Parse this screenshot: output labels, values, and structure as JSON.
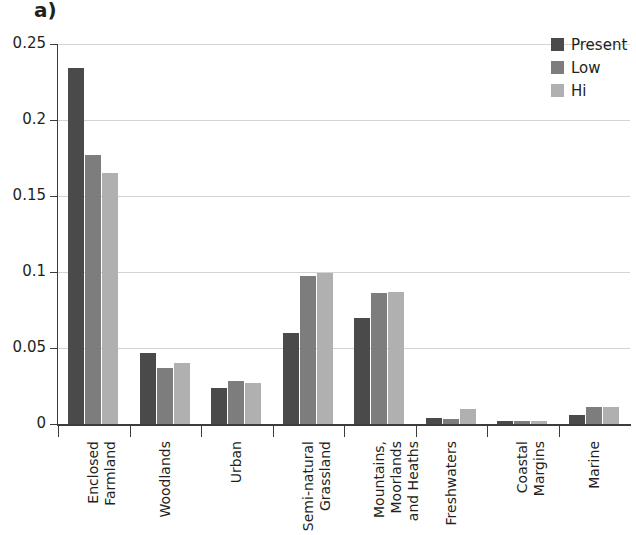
{
  "panel": {
    "label": "a)",
    "title_sliver": ""
  },
  "legend": {
    "position": "top-right",
    "entries": [
      {
        "label": "Present",
        "color": "#4a4a4a"
      },
      {
        "label": "Low",
        "color": "#7d7d7d"
      },
      {
        "label": "Hi",
        "color": "#b0b0b0"
      }
    ]
  },
  "chart_data": {
    "type": "bar",
    "title": "",
    "xlabel": "",
    "ylabel": "",
    "ylim": [
      0,
      0.25
    ],
    "yticks": [
      "0",
      "0.05",
      "0.1",
      "0.15",
      "0.2",
      "0.25"
    ],
    "ytick_values": [
      0,
      0.05,
      0.1,
      0.15,
      0.2,
      0.25
    ],
    "grid": true,
    "legend_position": "top-right",
    "categories": [
      "Enclosed\nFarmland",
      "Woodlands",
      "Urban",
      "Semi-natural\nGrassland",
      "Mountains,\nMoorlands\nand Heaths",
      "Freshwaters",
      "Coastal\nMargins",
      "Marine"
    ],
    "series": [
      {
        "name": "Present",
        "color": "#4a4a4a",
        "values": [
          0.234,
          0.047,
          0.024,
          0.06,
          0.07,
          0.004,
          0.002,
          0.006
        ]
      },
      {
        "name": "Low",
        "color": "#7d7d7d",
        "values": [
          0.177,
          0.037,
          0.028,
          0.0975,
          0.086,
          0.003,
          0.002,
          0.011
        ]
      },
      {
        "name": "Hi",
        "color": "#b0b0b0",
        "values": [
          0.165,
          0.04,
          0.027,
          0.0995,
          0.087,
          0.01,
          0.002,
          0.011
        ]
      }
    ]
  }
}
